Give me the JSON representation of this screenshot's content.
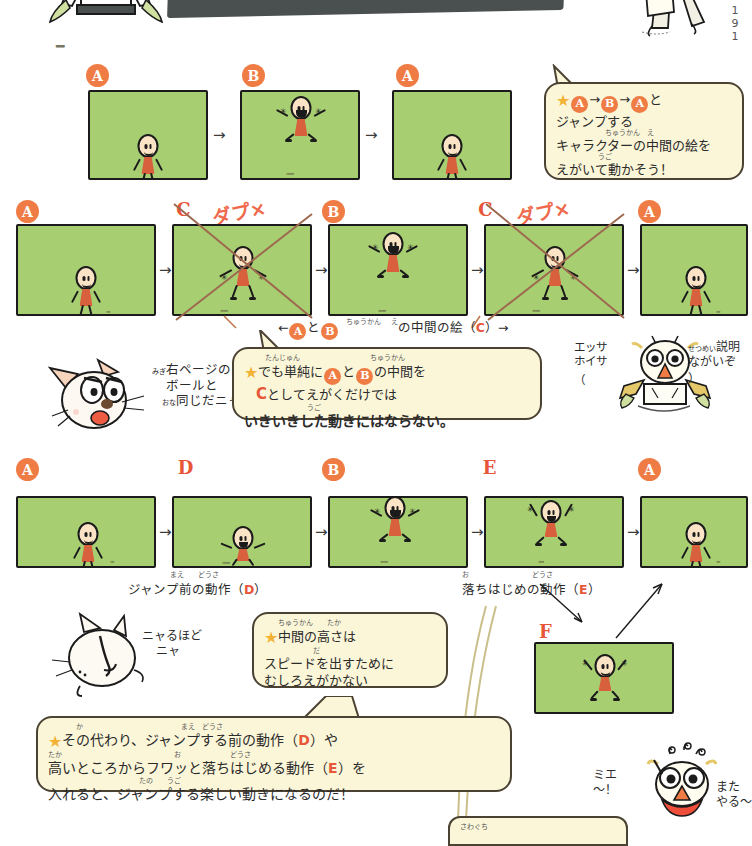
{
  "header": {
    "title": "　ジャンプするキャラクター",
    "page_number": "1 9 1"
  },
  "rows": [
    {
      "id": "row-1",
      "frames": [
        {
          "label": "A",
          "label_style": "circle",
          "pose": "stand",
          "ng": false
        },
        {
          "label": "B",
          "label_style": "circle",
          "pose": "jump",
          "ng": false
        },
        {
          "label": "A",
          "label_style": "circle",
          "pose": "stand",
          "ng": false
        }
      ],
      "arrows": [
        "→",
        "→"
      ]
    },
    {
      "id": "row-2",
      "frames": [
        {
          "label": "A",
          "label_style": "circle",
          "pose": "stand",
          "ng": false
        },
        {
          "label": "C",
          "label_style": "plain",
          "pose": "mid",
          "ng": true,
          "ng_label": "ダプ×"
        },
        {
          "label": "B",
          "label_style": "circle",
          "pose": "jump",
          "ng": false
        },
        {
          "label": "C",
          "label_style": "plain",
          "pose": "mid",
          "ng": true,
          "ng_label": "ダプ×"
        },
        {
          "label": "A",
          "label_style": "circle",
          "pose": "stand",
          "ng": false
        }
      ],
      "arrows": [
        "→",
        "→",
        "→",
        "→"
      ],
      "caption": {
        "prefix": "←",
        "a": "A",
        "mid_text": "と",
        "b": "B",
        "ruby": "ちゅうかん　え",
        "text": "の中間の絵（",
        "c": "C",
        "suffix": "）→"
      }
    },
    {
      "id": "row-3",
      "frames": [
        {
          "label": "A",
          "label_style": "circle",
          "pose": "stand",
          "ng": false
        },
        {
          "label": "D",
          "label_style": "plain",
          "pose": "crouch",
          "ng": false
        },
        {
          "label": "B",
          "label_style": "circle",
          "pose": "jump",
          "ng": false
        },
        {
          "label": "E",
          "label_style": "plain",
          "pose": "fall",
          "ng": false
        },
        {
          "label": "A",
          "label_style": "circle",
          "pose": "stand",
          "ng": false
        }
      ],
      "arrows": [
        "→",
        "→",
        "→",
        "→"
      ],
      "captions": [
        {
          "ruby": "まえ　どうさ",
          "text": "ジャンプ前の動作（",
          "letter": "D",
          "suffix": "）"
        },
        {
          "ruby": "お　　　どうさ",
          "text": "落ちはじめの動作（",
          "letter": "E",
          "suffix": "）"
        }
      ]
    }
  ],
  "frame_f": {
    "label": "F",
    "label_style": "plain",
    "pose": "peak"
  },
  "bubbles": [
    {
      "id": "bubble-1",
      "lines": [
        {
          "star": true,
          "parts": [
            {
              "type": "circle",
              "text": "A"
            },
            {
              "type": "text",
              "text": "→"
            },
            {
              "type": "circle",
              "text": "B"
            },
            {
              "type": "text",
              "text": "→"
            },
            {
              "type": "circle",
              "text": "A"
            },
            {
              "type": "text",
              "text": "と"
            }
          ]
        },
        {
          "star": false,
          "parts": [
            {
              "type": "text",
              "text": "ジャンプする"
            }
          ]
        },
        {
          "star": false,
          "ruby": "ちゅうかん　え",
          "parts": [
            {
              "type": "text",
              "text": "キャラクターの中間の絵を"
            }
          ]
        },
        {
          "star": false,
          "ruby": "　　　　うご",
          "parts": [
            {
              "type": "text",
              "text": "えがいて動かそう！"
            }
          ]
        }
      ]
    },
    {
      "id": "bubble-2",
      "lines": [
        {
          "star": true,
          "ruby": "　　たんじゅん　　　　　ちゅうかん",
          "parts": [
            {
              "type": "text",
              "text": "でも単純に"
            },
            {
              "type": "circle",
              "text": "A"
            },
            {
              "type": "text",
              "text": "と"
            },
            {
              "type": "circle",
              "text": "B"
            },
            {
              "type": "text",
              "text": "の中間を"
            }
          ]
        },
        {
          "star": false,
          "parts": [
            {
              "type": "letter",
              "text": "C"
            },
            {
              "type": "text",
              "text": "としてえがくだけでは"
            }
          ]
        },
        {
          "star": false,
          "ruby": "　　　　　　　うご",
          "bold": true,
          "parts": [
            {
              "type": "text",
              "text": "いきいきした動きにはならない。"
            }
          ]
        }
      ]
    },
    {
      "id": "bubble-3",
      "lines": [
        {
          "star": true,
          "ruby": "　ちゅうかん　　たか",
          "parts": [
            {
              "type": "text",
              "text": "中間の高さは"
            }
          ]
        },
        {
          "star": false,
          "ruby": "　　　　　だ",
          "parts": [
            {
              "type": "text",
              "text": "スピードを出すために"
            }
          ]
        },
        {
          "star": false,
          "parts": [
            {
              "type": "text",
              "text": "むしろえがかない"
            }
          ]
        }
      ]
    },
    {
      "id": "bubble-4",
      "lines": [
        {
          "star": true,
          "ruby": "　　　か　　　　　　　　　まえ　どうさ",
          "parts": [
            {
              "type": "text",
              "text": "その代わり、ジャンプする前の動作（"
            },
            {
              "type": "letter",
              "text": "D"
            },
            {
              "type": "text",
              "text": "）や"
            }
          ]
        },
        {
          "star": false,
          "ruby": "たか　　　　　　　　　　　　お　　　　どうさ",
          "parts": [
            {
              "type": "text",
              "text": "高いところからフワッと落ちはじめる動作（"
            },
            {
              "type": "letter",
              "text": "E"
            },
            {
              "type": "text",
              "text": "）を"
            }
          ]
        },
        {
          "star": false,
          "ruby": "　　　　　　　　　　　　たの　　うご",
          "parts": [
            {
              "type": "text",
              "text": "入れると、ジャンプする楽しい動きになるのだ！"
            }
          ]
        }
      ]
    }
  ],
  "characters": [
    {
      "id": "cat-1",
      "name": "cat-character",
      "note_lines": [
        "右ページの",
        "ボールと",
        "同じだニャ"
      ],
      "note_ruby": [
        "みぎ",
        "",
        "おな"
      ]
    },
    {
      "id": "bird-1",
      "name": "bird-character",
      "note_left": [
        "エッサ",
        "ホイサ"
      ],
      "note_right": [
        "（説明",
        "ながいぞ）"
      ],
      "note_right_ruby": "せつめい"
    },
    {
      "id": "cat-2",
      "name": "cat-character-2",
      "note_lines": [
        "ニャるほど",
        "ニャ"
      ]
    },
    {
      "id": "bird-2",
      "name": "bird-character-2",
      "note_left": [
        "ミエ",
        "〜！"
      ],
      "note_right": [
        "また",
        "やる〜"
      ]
    },
    {
      "id": "kid-top-left",
      "name": "kid-character-top-left"
    },
    {
      "id": "kid-top-right",
      "name": "kid-character-top-right"
    }
  ],
  "colors": {
    "frame_green": "#a8ce72",
    "label_orange": "#ef7c45",
    "letter_red": "#e8563a",
    "bubble_cream": "#fbf6d8",
    "ink": "#1b1b1b",
    "ng_brown": "#9d6a4f",
    "body_orange": "#d9603c",
    "skin": "#fbe4c6"
  }
}
